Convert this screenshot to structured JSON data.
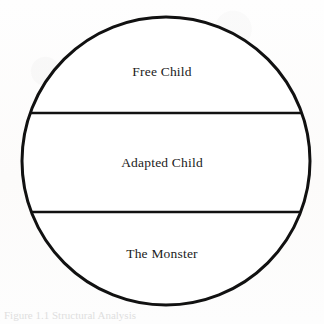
{
  "figure": {
    "type": "segmented-circle-diagram",
    "background_color": "#fdfdfc",
    "stroke_color": "#111111",
    "fill_color": "#ffffff",
    "circle": {
      "center_x": 166,
      "center_y": 161,
      "radius": 144,
      "stroke_width": 3
    },
    "divider_lines": [
      {
        "name": "upper-divider",
        "y": 113
      },
      {
        "name": "lower-divider",
        "y": 212
      }
    ],
    "segments": [
      {
        "id": "free-child",
        "label": "Free Child",
        "position": "top"
      },
      {
        "id": "adapted-child",
        "label": "Adapted Child",
        "position": "middle"
      },
      {
        "id": "the-monster",
        "label": "The Monster",
        "position": "bottom"
      }
    ],
    "caption_fragment": "Figure 1.1  Structural Analysis"
  }
}
